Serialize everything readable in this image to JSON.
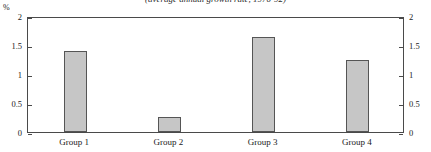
{
  "chart_data": {
    "type": "bar",
    "title": "(average annual growth rate, 1970-92)",
    "xlabel": "",
    "ylabel": "%",
    "unit_label": "%",
    "categories": [
      "Group 1",
      "Group 2",
      "Group 3",
      "Group 4"
    ],
    "values": [
      1.4,
      0.26,
      1.64,
      1.24
    ],
    "ylim": [
      0,
      2
    ],
    "yticks": [
      0,
      0.5,
      1,
      1.5,
      2
    ],
    "ytick_labels": [
      "0",
      "0.5",
      "1",
      "1.5",
      "2"
    ],
    "right_axis": true,
    "right_ytick_labels": [
      "0",
      "0.5",
      "1",
      "1.5",
      "2"
    ],
    "grid": false,
    "legend": null,
    "bar_fill_color": "#c6c6c6",
    "bar_edge_color": "#555555",
    "axis_color": "#4a4a4a"
  }
}
